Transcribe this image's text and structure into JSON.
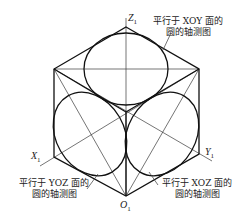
{
  "axes": {
    "z_label": "Z",
    "z_sub": "1",
    "x_label": "X",
    "x_sub": "1",
    "y_label": "Y",
    "y_sub": "1",
    "o_label": "O",
    "o_sub": "1"
  },
  "annotations": {
    "xoy": {
      "line1": "平行于 XOY 面的",
      "line2": "圆的轴测图"
    },
    "yoz": {
      "line1": "平行于 YOZ 面的",
      "line2": "圆的轴测图"
    },
    "xoz": {
      "line1": "平行于 XOZ 面的",
      "line2": "圆的轴测图"
    }
  },
  "colors": {
    "line": "#111111",
    "background": "#ffffff"
  }
}
